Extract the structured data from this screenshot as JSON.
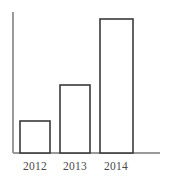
{
  "chart_data": {
    "type": "bar",
    "title": "",
    "subtitle": "",
    "xlabel": "",
    "ylabel": "",
    "categories": [
      "2012",
      "2013",
      "2014"
    ],
    "values": [
      1,
      2.1,
      4.2
    ],
    "bar_pixel_heights": [
      32,
      68,
      134
    ],
    "ylim": [
      0,
      4.6
    ],
    "grid": false,
    "legend": null,
    "annotations": [],
    "series": [
      {
        "name": "",
        "values": [
          1,
          2.1,
          4.2
        ]
      }
    ],
    "axis": {
      "y_axis_visible": true,
      "x_axis_visible": true,
      "tick_marks": false,
      "y_tick_labels": []
    },
    "style": {
      "bar_fill": "#ffffff",
      "bar_stroke": "#3a3a3a",
      "axis_color": "#9a9a9a",
      "label_color": "#4a4a4a",
      "background": "#ffffff"
    },
    "geometry": {
      "baseline_y": 153,
      "y_axis_x": 13,
      "y_axis_top": 12,
      "x_axis_right": 160,
      "bars": [
        {
          "x0": 20,
          "x1": 50,
          "top": 121
        },
        {
          "x0": 60,
          "x1": 90,
          "top": 85
        },
        {
          "x0": 100,
          "x1": 133,
          "top": 19
        }
      ],
      "label_y": 170,
      "label_centers": [
        35,
        75,
        116
      ]
    }
  }
}
